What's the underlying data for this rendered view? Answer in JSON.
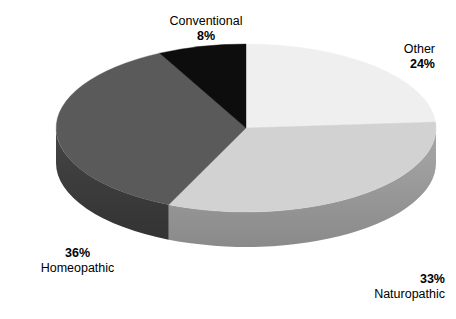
{
  "chart_data": {
    "type": "pie",
    "title": "",
    "subtitle": "",
    "xlabel": "",
    "ylabel": "",
    "grid": false,
    "legend_position": "none",
    "style": "3d-pie",
    "total": 101,
    "unit": "%",
    "start_angle_deg": 0,
    "direction": "clockwise",
    "categories": [
      "Other",
      "Naturopathic",
      "Homeopathic",
      "Conventional"
    ],
    "values": [
      24,
      33,
      36,
      8
    ],
    "colors": [
      "#efefef",
      "#d2d2d2",
      "#5a5a5a",
      "#0d0d0d"
    ],
    "side_colors": [
      "#b4b4b4",
      "#9a9a9a",
      "#3c3c3c",
      "#000000"
    ],
    "slices": [
      {
        "label": "Other",
        "value": 24,
        "value_text": "24%",
        "color": "#efefef",
        "side_color": "#b4b4b4",
        "start_angle_deg": 0,
        "end_angle_deg": 86
      },
      {
        "label": "Naturopathic",
        "value": 33,
        "value_text": "33%",
        "color": "#d2d2d2",
        "side_color": "#9a9a9a",
        "start_angle_deg": 86,
        "end_angle_deg": 204
      },
      {
        "label": "Homeopathic",
        "value": 36,
        "value_text": "36%",
        "color": "#5a5a5a",
        "side_color": "#3c3c3c",
        "start_angle_deg": 204,
        "end_angle_deg": 333
      },
      {
        "label": "Conventional",
        "value": 8,
        "value_text": "8%",
        "color": "#0d0d0d",
        "side_color": "#000000",
        "start_angle_deg": 333,
        "end_angle_deg": 360
      }
    ]
  },
  "labels": {
    "conventional": {
      "category": "Conventional",
      "percent": "8%"
    },
    "other": {
      "category": "Other",
      "percent": "24%"
    },
    "naturopathic": {
      "category": "Naturopathic",
      "percent": "33%"
    },
    "homeopathic": {
      "category": "Homeopathic",
      "percent": "36%"
    }
  }
}
